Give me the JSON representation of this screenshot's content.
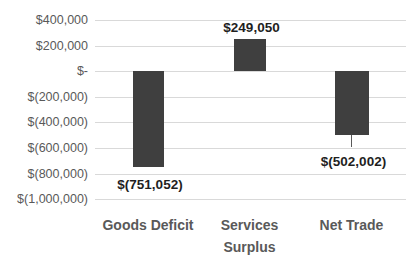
{
  "chart_data": {
    "type": "bar",
    "title": "",
    "xlabel": "",
    "ylabel": "",
    "categories": [
      "Goods Deficit",
      "Services Surplus",
      "Net Trade"
    ],
    "values": [
      -751052,
      249050,
      -502002
    ],
    "data_labels": [
      "$(751,052)",
      "$249,050",
      "$(502,002)"
    ],
    "yticks": [
      "$400,000",
      "$200,000",
      "$-",
      "$(200,000)",
      "$(400,000)",
      "$(600,000)",
      "$(800,000)",
      "$(1,000,000)"
    ],
    "ylim": [
      -1000000,
      400000
    ],
    "ytick_step": 200000,
    "grid": true,
    "legend": false,
    "colors": {
      "bar": "#3f3f3f",
      "gridline": "#d9d9d9",
      "axis_label": "#595959",
      "category_label": "#595959",
      "data_label": "#1f1f1f",
      "leader_line": "#595959",
      "background": "#ffffff"
    }
  }
}
